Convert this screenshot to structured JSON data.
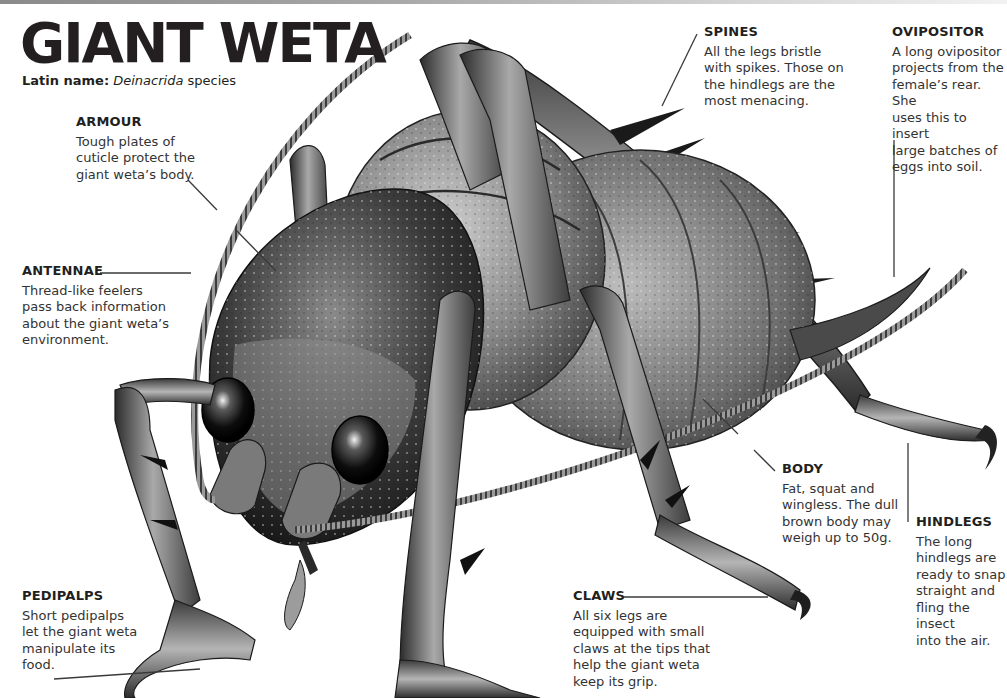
{
  "page": {
    "title": "GIANT WETA",
    "latin_label": "Latin name:",
    "latin_genus": "Deinacrida",
    "latin_suffix": "species"
  },
  "callouts": {
    "armour": {
      "heading": "ARMOUR",
      "text": "Tough plates of\ncuticle protect the\ngiant weta’s body."
    },
    "antennae": {
      "heading": "ANTENNAE",
      "text": "Thread-like feelers\npass back information\nabout the giant weta’s\nenvironment."
    },
    "pedipalps": {
      "heading": "PEDIPALPS",
      "text": "Short pedipalps\nlet the giant weta\nmanipulate its\nfood."
    },
    "spines": {
      "heading": "SPINES",
      "text": "All the legs bristle\nwith spikes. Those on\nthe hindlegs are the\nmost menacing."
    },
    "ovipositor": {
      "heading": "OVIPOSITOR",
      "text": "A long ovipositor\nprojects from the\nfemale’s rear. She\nuses this to insert\nlarge batches of\neggs into soil."
    },
    "body": {
      "heading": "BODY",
      "text": "Fat, squat and\nwingless. The dull\nbrown body may\nweigh up to 50g."
    },
    "hindlegs": {
      "heading": "HINDLEGS",
      "text": "The long\nhindlegs are\nready to snap\nstraight and\nfling the insect\ninto the air."
    },
    "claws": {
      "heading": "CLAWS",
      "text": "All six legs are\nequipped with small\nclaws at the tips that\nhelp the giant weta\nkeep its grip."
    }
  },
  "colors": {
    "text": "#231f20",
    "body_text": "#333333",
    "leader_line": "#3a3a3a",
    "illustration_dark": "#1e1e1e",
    "illustration_mid": "#6e6e6e",
    "illustration_light": "#c8c8c8"
  }
}
